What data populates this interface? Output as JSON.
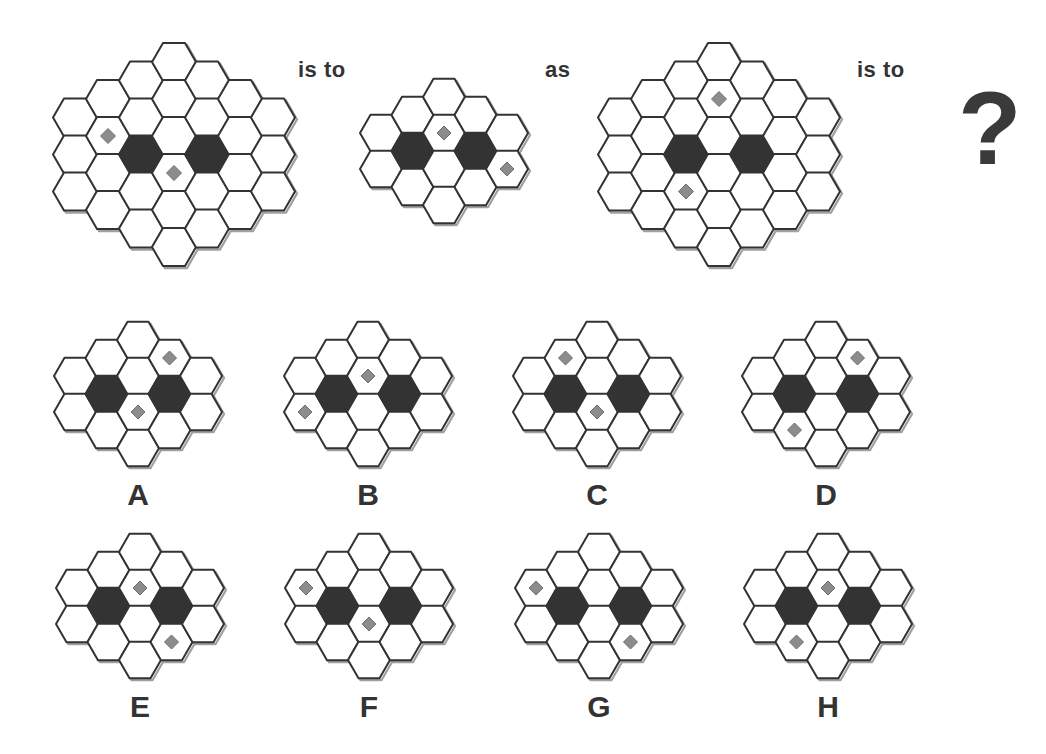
{
  "puzzle": {
    "connector_1": "is to",
    "connector_2": "as",
    "connector_3": "is to",
    "unknown": "?"
  },
  "colors": {
    "outline": "#333333",
    "shadow": "#a0a0a0",
    "cell_fill": "#ffffff",
    "dark_cell": "#333333",
    "diamond_fill": "#8c8c8c",
    "diamond_edge": "#6e6e6e"
  },
  "grids": {
    "example_1": {
      "type": "large",
      "x0": 75,
      "top": 62,
      "dark": [
        [
          2,
          2
        ],
        [
          4,
          2
        ]
      ],
      "diamonds": [
        [
          1,
          1
        ],
        [
          3,
          3
        ]
      ]
    },
    "example_2": {
      "type": "small",
      "x0": 381,
      "top": 97,
      "dark": [
        [
          1,
          1
        ],
        [
          3,
          1
        ]
      ],
      "diamonds": [
        [
          2,
          1
        ],
        [
          4,
          1
        ]
      ]
    },
    "example_3": {
      "type": "large",
      "x0": 620,
      "top": 62,
      "dark": [
        [
          2,
          2
        ],
        [
          4,
          2
        ]
      ],
      "diamonds": [
        [
          3,
          1
        ],
        [
          2,
          3
        ]
      ]
    }
  },
  "options": [
    {
      "label": "A",
      "x0": 75,
      "top": 340,
      "diamonds": [
        [
          3,
          0
        ],
        [
          2,
          2
        ]
      ]
    },
    {
      "label": "B",
      "x0": 305,
      "top": 340,
      "diamonds": [
        [
          2,
          1
        ],
        [
          0,
          1
        ]
      ]
    },
    {
      "label": "C",
      "x0": 534,
      "top": 340,
      "diamonds": [
        [
          1,
          0
        ],
        [
          2,
          2
        ]
      ]
    },
    {
      "label": "D",
      "x0": 763,
      "top": 340,
      "diamonds": [
        [
          3,
          0
        ],
        [
          1,
          2
        ]
      ]
    },
    {
      "label": "E",
      "x0": 77,
      "top": 552,
      "diamonds": [
        [
          2,
          1
        ],
        [
          3,
          2
        ]
      ]
    },
    {
      "label": "F",
      "x0": 306,
      "top": 552,
      "diamonds": [
        [
          0,
          0
        ],
        [
          2,
          2
        ]
      ]
    },
    {
      "label": "G",
      "x0": 536,
      "top": 552,
      "diamonds": [
        [
          0,
          0
        ],
        [
          3,
          2
        ]
      ]
    },
    {
      "label": "H",
      "x0": 765,
      "top": 552,
      "diamonds": [
        [
          2,
          1
        ],
        [
          1,
          2
        ]
      ]
    }
  ]
}
